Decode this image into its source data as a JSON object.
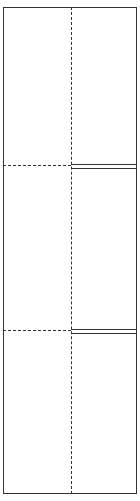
{
  "diagram": {
    "type": "folded-panel-layout",
    "rows": 3,
    "colors": {
      "line": "#333333",
      "background": "#ffffff"
    },
    "dividers": [
      {
        "y": 165,
        "left_style": "dashed",
        "right_style": "double"
      },
      {
        "y": 330,
        "left_style": "dashed",
        "right_style": "double"
      }
    ],
    "vertical_fold": {
      "x": 71,
      "style": "dashed"
    }
  }
}
